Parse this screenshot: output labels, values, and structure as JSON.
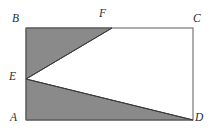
{
  "figure": {
    "kind": "plane-geometry-diagram",
    "canvas": {
      "width": 213,
      "height": 137
    },
    "colors": {
      "background": "#ffffff",
      "interior_fill": "#ffffff",
      "shaded_fill": "#8a8a8a",
      "outline_stroke": "#6b6b6b",
      "shaded_edge_stroke": "#3a3a3a",
      "label_color": "#2b2b2b"
    },
    "rectangle": {
      "name": "ABCD",
      "corners": [
        {
          "id": "B",
          "x": 26,
          "y": 28
        },
        {
          "id": "C",
          "x": 193,
          "y": 28
        },
        {
          "id": "D",
          "x": 193,
          "y": 120
        },
        {
          "id": "A",
          "x": 26,
          "y": 120
        }
      ]
    },
    "points": [
      {
        "id": "A",
        "label": "A",
        "x": 26,
        "y": 120,
        "on": "corner"
      },
      {
        "id": "B",
        "label": "B",
        "x": 26,
        "y": 28,
        "on": "corner"
      },
      {
        "id": "C",
        "label": "C",
        "x": 193,
        "y": 28,
        "on": "corner"
      },
      {
        "id": "D",
        "label": "D",
        "x": 193,
        "y": 120,
        "on": "corner"
      },
      {
        "id": "E",
        "label": "E",
        "x": 26,
        "y": 79,
        "on": "side-AB"
      },
      {
        "id": "F",
        "label": "F",
        "x": 112,
        "y": 28,
        "on": "side-BC"
      }
    ],
    "shaded_regions": [
      {
        "id": "triangle-BFE",
        "label": "BFE",
        "vertices": [
          [
            26,
            28
          ],
          [
            112,
            28
          ],
          [
            26,
            79
          ]
        ]
      },
      {
        "id": "triangle-EDA",
        "label": "EDA",
        "vertices": [
          [
            26,
            79
          ],
          [
            193,
            120
          ],
          [
            26,
            120
          ]
        ]
      }
    ],
    "white_region": {
      "id": "triangle-EFD-region",
      "label": "EFCD",
      "vertices": [
        [
          26,
          79
        ],
        [
          112,
          28
        ],
        [
          193,
          28
        ],
        [
          193,
          120
        ]
      ]
    },
    "segments": [
      {
        "id": "seg-AB",
        "from": "A",
        "to": "B",
        "style": "solid"
      },
      {
        "id": "seg-BC",
        "from": "B",
        "to": "C",
        "style": "solid"
      },
      {
        "id": "seg-CD",
        "from": "C",
        "to": "D",
        "style": "solid"
      },
      {
        "id": "seg-DA",
        "from": "D",
        "to": "A",
        "style": "solid"
      },
      {
        "id": "seg-EF",
        "from": "E",
        "to": "F",
        "style": "solid"
      },
      {
        "id": "seg-ED",
        "from": "E",
        "to": "D",
        "style": "solid"
      }
    ],
    "labels": {
      "A": "A",
      "B": "B",
      "C": "C",
      "D": "D",
      "E": "E",
      "F": "F"
    }
  }
}
